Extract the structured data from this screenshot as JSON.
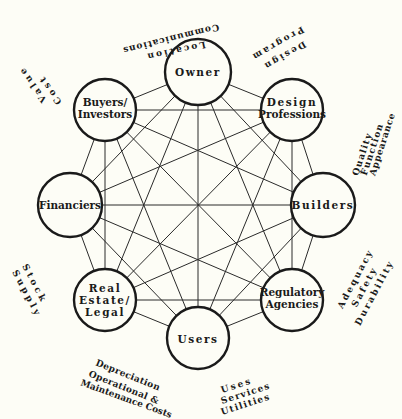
{
  "diagram": {
    "type": "fully-connected network of building-process stakeholders",
    "center": {
      "x": 198,
      "y": 205
    },
    "nodes": [
      {
        "id": "owner",
        "lines": [
          "Owner"
        ],
        "x": 198,
        "y": 72,
        "r": 32
      },
      {
        "id": "design-professions",
        "lines": [
          "Design",
          "Professions"
        ],
        "x": 292,
        "y": 110,
        "r": 32
      },
      {
        "id": "builders",
        "lines": [
          "Builders"
        ],
        "x": 323,
        "y": 205,
        "r": 32
      },
      {
        "id": "regulatory-agencies",
        "lines": [
          "Regulatory",
          "Agencies"
        ],
        "x": 292,
        "y": 300,
        "r": 32
      },
      {
        "id": "users",
        "lines": [
          "Users"
        ],
        "x": 198,
        "y": 338,
        "r": 32
      },
      {
        "id": "real-estate-legal",
        "lines": [
          "Real",
          "Estate/",
          "Legal"
        ],
        "x": 105,
        "y": 300,
        "r": 32
      },
      {
        "id": "financiers",
        "lines": [
          "Financiers"
        ],
        "x": 70,
        "y": 205,
        "r": 32
      },
      {
        "id": "buyers-investors",
        "lines": [
          "Buyers/",
          "Investors"
        ],
        "x": 105,
        "y": 110,
        "r": 32
      }
    ],
    "outer_labels": [
      {
        "id": "owner-concerns",
        "near": "owner",
        "lines": [
          "Location",
          "Communications"
        ]
      },
      {
        "id": "design-concerns",
        "near": "design-professions",
        "lines": [
          "Design",
          "Program"
        ]
      },
      {
        "id": "builders-concerns",
        "near": "builders",
        "lines": [
          "Quality",
          "Function",
          "Appearance"
        ]
      },
      {
        "id": "regulatory-concerns",
        "near": "regulatory-agencies",
        "lines": [
          "Adequacy",
          "Safety",
          "Durability"
        ]
      },
      {
        "id": "users-concerns",
        "near": "users",
        "lines": [
          "Uses",
          "Services",
          "Utilities"
        ]
      },
      {
        "id": "real-estate-concerns",
        "near": "real-estate-legal",
        "lines": [
          "Depreciation",
          "Operational &",
          "Maintenance Costs"
        ]
      },
      {
        "id": "financiers-concerns",
        "near": "financiers",
        "lines": [
          "Stock",
          "Supply"
        ]
      },
      {
        "id": "buyers-concerns",
        "near": "buyers-investors",
        "lines": [
          "Cost",
          "Value"
        ]
      }
    ],
    "edges": "every node connected to every other node (28 edges)"
  },
  "text": {
    "owner": "Owner",
    "design_1": "Design",
    "design_2": "Professions",
    "builders": "Builders",
    "regulatory_1": "Regulatory",
    "regulatory_2": "Agencies",
    "users": "Users",
    "realestate_1": "Real",
    "realestate_2": "Estate/",
    "realestate_3": "Legal",
    "financiers": "Financiers",
    "buyers_1": "Buyers/",
    "buyers_2": "Investors",
    "loc": "Location",
    "comm": "Communications",
    "des": "Design",
    "prog": "Program",
    "qual": "Quality",
    "func": "Function",
    "appear": "Appearance",
    "adeq": "Adequacy",
    "safety": "Safety",
    "dura": "Durability",
    "uses": "Uses",
    "services": "Services",
    "utilities": "Utilities",
    "deprec": "Depreciation",
    "oper": "Operational &",
    "maint": "Maintenance Costs",
    "stock": "Stock",
    "supply": "Supply",
    "cost": "Cost",
    "value": "Value"
  }
}
